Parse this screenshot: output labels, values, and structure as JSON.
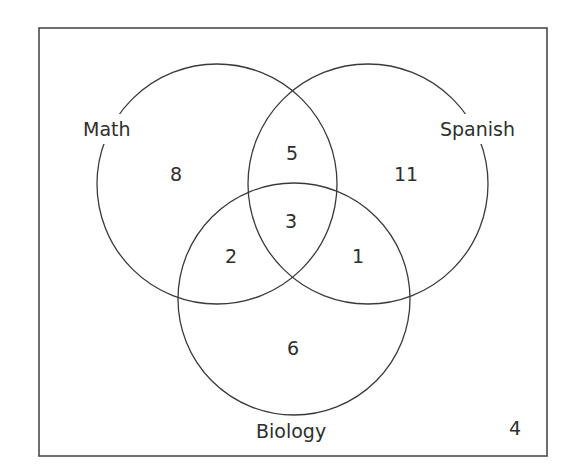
{
  "diagram": {
    "type": "venn",
    "sets": [
      {
        "name": "Math",
        "label": "Math"
      },
      {
        "name": "Spanish",
        "label": "Spanish"
      },
      {
        "name": "Biology",
        "label": "Biology"
      }
    ],
    "regions": {
      "math_only": "8",
      "spanish_only": "11",
      "biology_only": "6",
      "math_spanish_only": "5",
      "math_biology_only": "2",
      "spanish_biology_only": "1",
      "all_three": "3",
      "none": "4"
    },
    "colors": {
      "stroke": "#3a3a3a",
      "text": "#2e2e2e",
      "background": "#ffffff"
    }
  }
}
